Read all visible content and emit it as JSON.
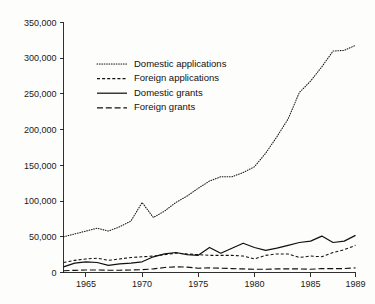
{
  "chart_data": {
    "type": "line",
    "title": "",
    "subtitle": "",
    "xlabel": "",
    "ylabel": "",
    "xlim": [
      1963,
      1989
    ],
    "ylim": [
      0,
      350000
    ],
    "grid": false,
    "legend_position": "upper-left-inset",
    "x": [
      1963,
      1964,
      1965,
      1966,
      1967,
      1968,
      1969,
      1970,
      1971,
      1972,
      1973,
      1974,
      1975,
      1976,
      1977,
      1978,
      1979,
      1980,
      1981,
      1982,
      1983,
      1984,
      1985,
      1986,
      1987,
      1988,
      1989
    ],
    "x_tick_labels": [
      "1965",
      "1970",
      "1975",
      "1980",
      "1985",
      "1989"
    ],
    "x_tick_values": [
      1965,
      1970,
      1975,
      1980,
      1985,
      1989
    ],
    "y_tick_labels": [
      "0",
      "50,000",
      "100,000",
      "150,000",
      "200,000",
      "250,000",
      "300,000",
      "350,000"
    ],
    "y_tick_values": [
      0,
      50000,
      100000,
      150000,
      200000,
      250000,
      300000,
      350000
    ],
    "series": [
      {
        "name": "Domestic applications",
        "style": "dotted",
        "values": [
          50000,
          54000,
          58000,
          62000,
          58000,
          64000,
          72000,
          98000,
          77000,
          86000,
          98000,
          107000,
          118000,
          128000,
          134000,
          134000,
          140000,
          148000,
          167000,
          190000,
          215000,
          252000,
          268000,
          288000,
          310000,
          311000,
          318000
        ]
      },
      {
        "name": "Foreign applications",
        "style": "short-dash",
        "values": [
          14000,
          17000,
          19000,
          20000,
          17000,
          19000,
          21000,
          22000,
          23000,
          25000,
          27000,
          26000,
          25000,
          24000,
          24000,
          24000,
          23000,
          19000,
          24000,
          26000,
          26000,
          21000,
          23000,
          22000,
          28000,
          32000,
          38000
        ]
      },
      {
        "name": "Domestic grants",
        "style": "solid",
        "values": [
          8000,
          13000,
          15000,
          14000,
          10000,
          12000,
          13000,
          15000,
          22000,
          26000,
          28000,
          25000,
          24000,
          35000,
          27000,
          34000,
          41000,
          35000,
          31000,
          34000,
          38000,
          42000,
          44000,
          51000,
          42000,
          44000,
          52000
        ]
      },
      {
        "name": "Foreign grants",
        "style": "long-dash",
        "values": [
          2500,
          3000,
          3500,
          3500,
          3200,
          3200,
          3500,
          4000,
          5000,
          7000,
          8000,
          7500,
          6000,
          6500,
          6000,
          5500,
          5000,
          4500,
          4500,
          5000,
          5000,
          5000,
          4500,
          5500,
          5500,
          5500,
          6500
        ]
      }
    ]
  },
  "legend": {
    "items": [
      {
        "label": "Domestic applications",
        "style": "dotted"
      },
      {
        "label": "Foreign applications",
        "style": "short-dash"
      },
      {
        "label": "Domestic grants",
        "style": "solid"
      },
      {
        "label": "Foreign grants",
        "style": "long-dash"
      }
    ]
  },
  "colors": {
    "ink": "#111111",
    "axis": "#1a1a1a",
    "background": "#fdfdfc"
  }
}
